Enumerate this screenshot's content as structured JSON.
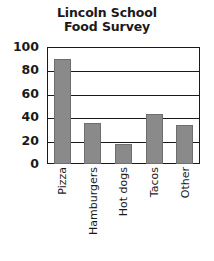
{
  "chart_data": {
    "type": "bar",
    "title": "Lincoln School Food Survey",
    "title_lines": [
      "Lincoln School",
      "Food Survey"
    ],
    "categories": [
      "Pizza",
      "Hamburgers",
      "Hot dogs",
      "Tacos",
      "Other"
    ],
    "values": [
      90,
      35,
      17,
      43,
      33
    ],
    "xlabel": "",
    "ylabel": "",
    "ylim": [
      0,
      100
    ],
    "yticks": [
      0,
      20,
      40,
      60,
      80,
      100
    ],
    "ytick_labels": [
      "0",
      "20",
      "40",
      "60",
      "80",
      "100"
    ],
    "grid": true,
    "grid_axis": "y",
    "legend": false,
    "legend_position": "none",
    "bar_color": "#8a8a8a",
    "bar_edge_color": "#6e6e6e",
    "axis_color": "#1a1a1a",
    "background_color": "#ffffff",
    "xtick_label_rotation": 90
  }
}
